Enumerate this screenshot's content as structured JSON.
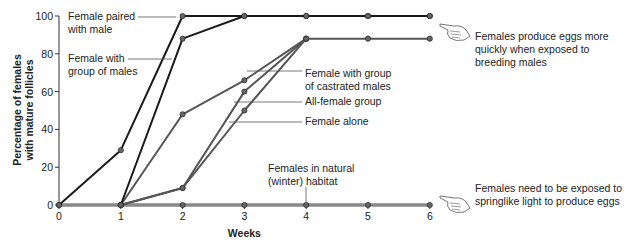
{
  "chart_data": {
    "type": "line",
    "title": "",
    "xlabel": "Weeks",
    "ylabel": "Percentage of females with mature follicles",
    "ylabel_lines": [
      "Percentage of females",
      "with mature follicles"
    ],
    "x": [
      0,
      1,
      2,
      3,
      4,
      5,
      6
    ],
    "xlim": [
      0,
      6
    ],
    "ylim": [
      0,
      100
    ],
    "yticks": [
      0,
      20,
      40,
      60,
      80,
      100
    ],
    "xticks": [
      0,
      1,
      2,
      3,
      4,
      5,
      6
    ],
    "grid": false,
    "series": [
      {
        "name": "Female paired with male",
        "label_lines": [
          "Female paired",
          "with male"
        ],
        "x": [
          0,
          1,
          2,
          3,
          4,
          5,
          6
        ],
        "values": [
          0,
          29,
          100,
          100,
          100,
          100,
          100
        ],
        "color": "#1a1a1a"
      },
      {
        "name": "Female with group of males",
        "label_lines": [
          "Female with",
          "group of males"
        ],
        "x": [
          1,
          2,
          3,
          4,
          5,
          6
        ],
        "values": [
          0,
          88,
          100,
          100,
          100,
          100
        ],
        "color": "#1a1a1a"
      },
      {
        "name": "Female with group of castrated males",
        "label_lines": [
          "Female with group",
          "of castrated males"
        ],
        "x": [
          1,
          2,
          3,
          4,
          5,
          6
        ],
        "values": [
          0,
          48,
          66,
          88,
          88,
          88
        ],
        "color": "#555555"
      },
      {
        "name": "All-female group",
        "label_lines": [
          "All-female group"
        ],
        "x": [
          1,
          2,
          3,
          4
        ],
        "values": [
          0,
          9,
          60,
          88
        ],
        "color": "#555555"
      },
      {
        "name": "Female alone",
        "label_lines": [
          "Female alone"
        ],
        "x": [
          1,
          2,
          3,
          4
        ],
        "values": [
          0,
          9,
          50,
          88
        ],
        "color": "#555555"
      },
      {
        "name": "Females in natural (winter) habitat",
        "label_lines": [
          "Females in natural",
          "(winter) habitat"
        ],
        "x": [
          0,
          1,
          2,
          3,
          4,
          5,
          6
        ],
        "values": [
          0,
          0,
          0,
          0,
          0,
          0,
          0
        ],
        "color": "#888888"
      }
    ],
    "annotations": [
      {
        "icon": "pointing-hand-icon",
        "lines": [
          "Females produce eggs more",
          "quickly when exposed to",
          "breeding males"
        ]
      },
      {
        "icon": "pointing-hand-icon",
        "lines": [
          "Females need to be exposed to",
          "springlike light to produce eggs"
        ]
      }
    ]
  }
}
